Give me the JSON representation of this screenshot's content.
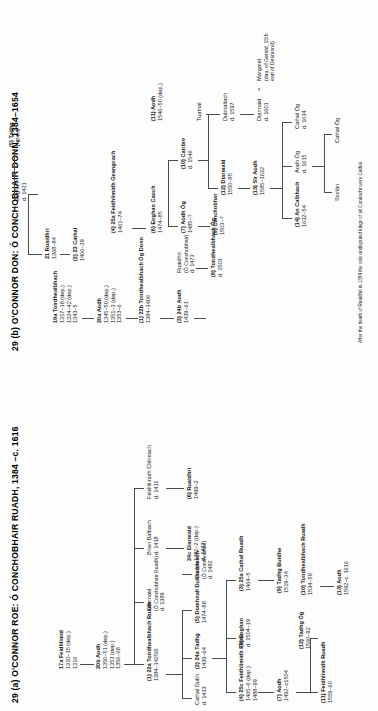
{
  "page": {
    "charts": [
      {
        "id": "29a",
        "title": "29 (a)  O'CONNOR ROE: Ó CONCHOBHAIR RUADH, 1384 –c. 1616",
        "nodes": [
          {
            "key": "a1",
            "name": "17a Feidhlimid",
            "bold": true,
            "lines": [
              "1310–15 (dep.)",
              "1316"
            ]
          },
          {
            "key": "a2",
            "name": "20b Aodh",
            "bold": true,
            "lines": [
              "1350–51 (dep.)",
              "1353 (dep.)",
              "1356–68"
            ]
          },
          {
            "key": "a3",
            "name": "Diarmaid",
            "bold": false,
            "lines": [
              "(Ó Conchobhair Ruadh)",
              "d. 1389"
            ]
          },
          {
            "key": "a4",
            "name": "Brian Balbach",
            "bold": false,
            "lines": [
              "d. 1418"
            ]
          },
          {
            "key": "a5",
            "name": "Feidhlimidh Cléireach",
            "bold": false,
            "lines": [
              "d. 1411"
            ]
          },
          {
            "key": "a6",
            "name": "(1) 22a Toirdhealbhach Ruadh",
            "bold": true,
            "lines": [
              "1384–1425/6"
            ]
          },
          {
            "key": "a7",
            "name": "24c Diarmaid",
            "bold": true,
            "lines": [
              "1481–2 (dep.)",
              "d. 1487"
            ]
          },
          {
            "key": "a8",
            "name": "(6) Ruaidhri",
            "bold": true,
            "lines": [
              "1499–2"
            ]
          },
          {
            "key": "a9",
            "name": "Cathal Dubh",
            "bold": false,
            "lines": [
              "d. 1433"
            ]
          },
          {
            "key": "a10",
            "name": "(2) 24a Tadhg",
            "bold": true,
            "lines": [
              "1439–64"
            ]
          },
          {
            "key": "a11",
            "name": "(5) Domhnall Dubhsúileach",
            "bold": true,
            "lines": [
              "1474–88"
            ]
          },
          {
            "key": "a12",
            "name": "Cairbre",
            "bold": false,
            "lines": [
              "(Ó Conchobhair)",
              "d. 1482"
            ]
          },
          {
            "key": "a13",
            "name": "(4) 25c Feidhlimidh Fionn",
            "bold": true,
            "lines": [
              "1465–6 (dep.)",
              "1488–99"
            ]
          },
          {
            "key": "a14",
            "name": "(8) Eoghan",
            "bold": true,
            "lines": [
              "d. 1504–19"
            ]
          },
          {
            "key": "a15",
            "name": "(3) 25a Cathal Ruadh",
            "bold": true,
            "lines": [
              "1464–5"
            ]
          },
          {
            "key": "a16",
            "name": "(9) Tadhg Buidhe",
            "bold": true,
            "lines": [
              "1519–34"
            ]
          },
          {
            "key": "a17",
            "name": "(7) Aodh",
            "bold": true,
            "lines": [
              "1492–c1504"
            ]
          },
          {
            "key": "a18",
            "name": "(10) Toirdhealbhach Ruadh",
            "bold": true,
            "lines": [
              "1534–59"
            ]
          },
          {
            "key": "a19",
            "name": "(12) Tadhg Óg",
            "bold": true,
            "lines": [
              "1560–92"
            ]
          },
          {
            "key": "a20",
            "name": "(11) Feidhlimidh Ruadh",
            "bold": true,
            "lines": [
              "1559–60"
            ]
          },
          {
            "key": "a21",
            "name": "(13) Aodh",
            "bold": true,
            "lines": [
              "1592–c. 1616"
            ]
          }
        ]
      },
      {
        "id": "29b",
        "title": "29 (b)  O'CONNOR DON: Ó CONCHOBHAIR DONN, 1384–1654",
        "nodes": [
          {
            "key": "b1",
            "name": "19a Toirdhealbhach",
            "bold": true,
            "lines": [
              "1317–18 (dep.)",
              "1324–42 (dep.)",
              "1343–5"
            ]
          },
          {
            "key": "b2",
            "name": "20a Aodh",
            "bold": true,
            "lines": [
              "1345–50 (dep.)",
              "1351–3 (dep.)",
              "1353–6"
            ]
          },
          {
            "key": "b3",
            "name": "21 Ruaidhri",
            "bold": true,
            "lines": [
              "1368–84"
            ]
          },
          {
            "key": "b4",
            "name": "(1) 22b Toirdhealbhach Óg Donn",
            "bold": true,
            "lines": [
              "1384–1406"
            ]
          },
          {
            "key": "b5",
            "name": "Eoghan",
            "bold": false,
            "lines": [
              "d. 1421"
            ]
          },
          {
            "key": "b6",
            "name": "Cathal",
            "bold": false,
            "lines": [
              "1406–39"
            ]
          },
          {
            "key": "b7",
            "name": "(2) 23 Cathal",
            "bold": true,
            "lines": [
              "1406–39"
            ]
          },
          {
            "key": "b8",
            "name": "(5) Tadhg",
            "bold": true,
            "lines": [
              "1474–6"
            ]
          },
          {
            "key": "b9",
            "name": "(3) 24b Aodh",
            "bold": true,
            "lines": [
              "1439–61"
            ]
          },
          {
            "key": "b10",
            "name": "Ruaidhri",
            "bold": false,
            "lines": [
              "(Ó Conchobhair)",
              "d. 1473"
            ]
          },
          {
            "key": "b11",
            "name": "(4) 25a Feidhlimidh Geangcach",
            "bold": true,
            "lines": [
              "1461–74"
            ]
          },
          {
            "key": "b12",
            "name": "(6) Eoghan Caoch",
            "bold": true,
            "lines": [
              "1474–85"
            ]
          },
          {
            "key": "b13",
            "name": "(11) Aodh",
            "bold": true,
            "lines": [
              "1546–50 (dep.)"
            ]
          },
          {
            "key": "b14",
            "name": "(7) Aodh Óg",
            "bold": true,
            "lines": [
              "1485–?"
            ]
          },
          {
            "key": "b15",
            "name": "(10) Cairbre",
            "bold": true,
            "lines": [
              "d. 1546"
            ]
          },
          {
            "key": "b16",
            "name": "(8) Toirdhealbhach Óg",
            "bold": true,
            "lines": [
              "d. 1503"
            ]
          },
          {
            "key": "b17",
            "name": "(9) Conchobhar",
            "bold": true,
            "lines": [
              "1503–?"
            ]
          },
          {
            "key": "b18",
            "name": "Tuathal",
            "bold": false,
            "lines": []
          },
          {
            "key": "b19",
            "name": "Dubhaltach",
            "bold": false,
            "lines": [
              "d. 1597"
            ]
          },
          {
            "key": "b20",
            "name": "Diarmaid",
            "bold": false,
            "lines": [
              "d. 1601"
            ]
          },
          {
            "key": "b21",
            "name": "Margaret",
            "bold": false,
            "lines": [
              "(dau. of Gerald, 15th",
              "earl of Desmond)"
            ]
          },
          {
            "key": "b22",
            "name": "(12) Diarmaid",
            "bold": true,
            "lines": [
              "1550–85"
            ]
          },
          {
            "key": "b23",
            "name": "(13) Sir Aodh",
            "bold": true,
            "lines": [
              "1585–1632"
            ]
          },
          {
            "key": "b24",
            "name": "Aodh Óg",
            "bold": false,
            "lines": [
              "d. 1615"
            ]
          },
          {
            "key": "b25",
            "name": "Cathal Óg",
            "bold": false,
            "lines": [
              "d. 1634"
            ]
          },
          {
            "key": "b26",
            "name": "(14) An Calbhach",
            "bold": true,
            "lines": [
              "1632–54"
            ]
          },
          {
            "key": "b27",
            "name": "Scolán",
            "bold": false,
            "lines": []
          },
          {
            "key": "b28",
            "name": "Cathal Óg",
            "bold": false,
            "lines": []
          }
        ],
        "marriage_symbol": "=",
        "footnote": "After the death of Ruaidhri in 1384 the only undisputed kings of all Connacht were Cathal"
      }
    ]
  }
}
